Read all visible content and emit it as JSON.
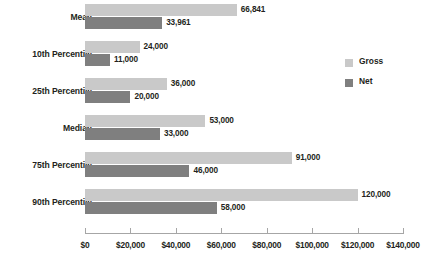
{
  "chart_data": {
    "type": "bar",
    "orientation": "horizontal",
    "title": "",
    "xlabel": "",
    "ylabel": "",
    "xlim": [
      0,
      140000
    ],
    "xticks": [
      "$0",
      "$20,000",
      "$40,000",
      "$60,000",
      "$80,000",
      "$100,000",
      "$120,000",
      "$140,000"
    ],
    "xtick_values": [
      0,
      20000,
      40000,
      60000,
      80000,
      100000,
      120000,
      140000
    ],
    "grid": false,
    "legend_position": "right",
    "categories": [
      "Mean",
      "10th Percentile",
      "25th Percentile",
      "Median",
      "75th Percentile",
      "90th Percentile"
    ],
    "series": [
      {
        "name": "Gross",
        "color": "#c9c9c9",
        "values": [
          66841,
          24000,
          36000,
          53000,
          91000,
          120000
        ],
        "labels": [
          "66,841",
          "24,000",
          "36,000",
          "53,000",
          "91,000",
          "120,000"
        ]
      },
      {
        "name": "Net",
        "color": "#7f7f7f",
        "values": [
          33961,
          11000,
          20000,
          33000,
          46000,
          58000
        ],
        "labels": [
          "33,961",
          "11,000",
          "20,000",
          "33,000",
          "46,000",
          "58,000"
        ]
      }
    ]
  },
  "legend": {
    "items": [
      {
        "label": "Gross",
        "color": "#c9c9c9"
      },
      {
        "label": "Net",
        "color": "#7f7f7f"
      }
    ]
  }
}
